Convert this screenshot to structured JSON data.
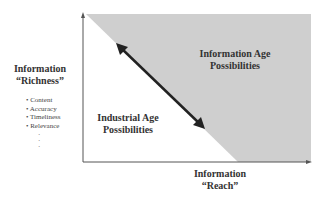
{
  "y_axis": {
    "title_line1": "Information",
    "title_line2": "“Richness”",
    "bullets": [
      "• Content",
      "• Accuracy",
      "• Timeliness",
      "• Relevance"
    ],
    "ellipsis": [
      "·",
      "·",
      "·"
    ]
  },
  "x_axis": {
    "title_line1": "Information",
    "title_line2": "“Reach”"
  },
  "regions": {
    "upper_line1": "Information Age",
    "upper_line2": "Possibilities",
    "lower_line1": "Industrial Age",
    "lower_line2": "Possibilities"
  },
  "colors": {
    "shaded_region": "#cfcfcf",
    "axes": "#555555",
    "arrow": "#222222"
  }
}
